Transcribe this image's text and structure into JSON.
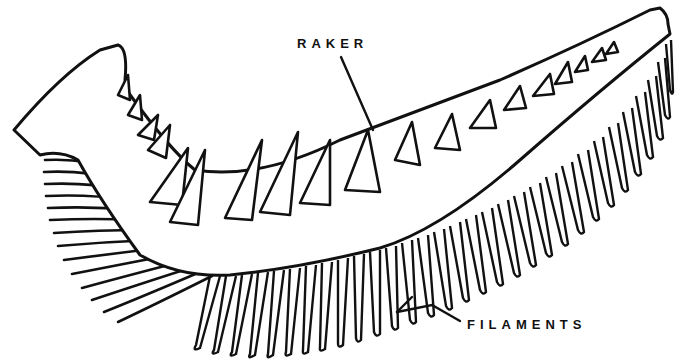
{
  "diagram": {
    "labels": {
      "raker": "RAKER",
      "filaments": "FILAMENTS"
    },
    "colors": {
      "ink": "#111111",
      "background": "#ffffff"
    },
    "parts": [
      "gill arch",
      "gill rakers",
      "gill filaments"
    ]
  }
}
